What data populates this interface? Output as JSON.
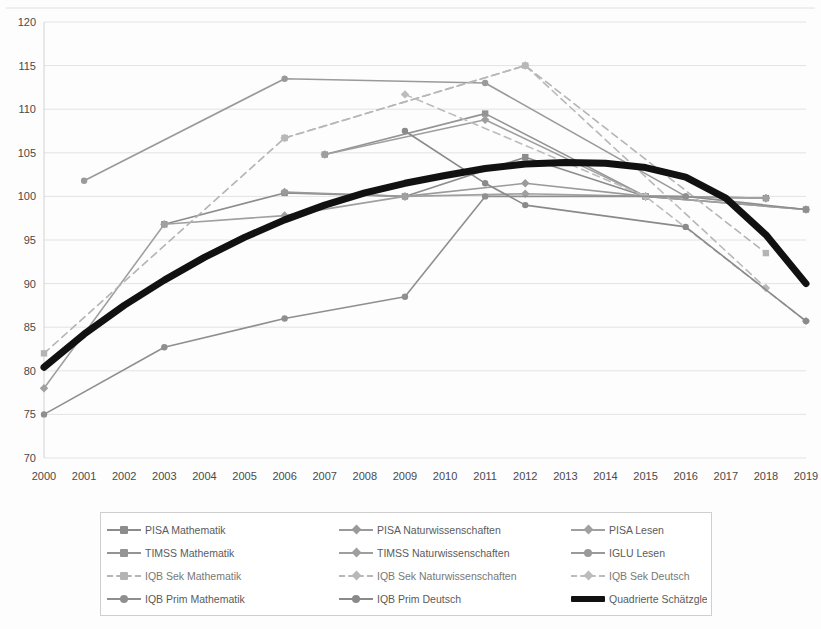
{
  "chart_data": {
    "type": "line",
    "title": "",
    "xlabel": "",
    "ylabel": "",
    "xlim": [
      2000,
      2019
    ],
    "ylim": [
      70,
      120
    ],
    "ytick_labels": [
      "120",
      "115",
      "110",
      "105",
      "100",
      "95",
      "90",
      "85",
      "80",
      "75",
      "70"
    ],
    "ytick_values": [
      120,
      115,
      110,
      105,
      100,
      95,
      90,
      85,
      80,
      75,
      70
    ],
    "xtick_labels": [
      "2000",
      "2001",
      "2002",
      "2003",
      "2004",
      "2005",
      "2006",
      "2007",
      "2008",
      "2009",
      "2010",
      "2011",
      "2012",
      "2013",
      "2014",
      "2015",
      "2016",
      "2017",
      "2018",
      "2019"
    ],
    "grid": true,
    "legend_position": "bottom",
    "series": [
      {
        "name": "PISA Mathematik",
        "color": "#8c8c8c",
        "style": "solid",
        "marker": "square",
        "points": [
          [
            2003,
            96.8
          ],
          [
            2006,
            100.4
          ],
          [
            2009,
            100.0
          ],
          [
            2012,
            104.5
          ],
          [
            2015,
            100.0
          ],
          [
            2018,
            99.8
          ]
        ]
      },
      {
        "name": "PISA Naturwissenschaften",
        "color": "#9a9a9a",
        "style": "solid",
        "marker": "diamond",
        "points": [
          [
            2006,
            100.5
          ],
          [
            2009,
            100.0
          ],
          [
            2012,
            101.5
          ],
          [
            2015,
            100.0
          ],
          [
            2018,
            99.8
          ]
        ]
      },
      {
        "name": "PISA Lesen",
        "color": "#a0a0a0",
        "style": "solid",
        "marker": "diamond",
        "points": [
          [
            2000,
            78.0
          ],
          [
            2003,
            96.8
          ],
          [
            2006,
            97.8
          ],
          [
            2009,
            100.0
          ],
          [
            2012,
            100.3
          ],
          [
            2015,
            100.0
          ],
          [
            2018,
            99.8
          ]
        ]
      },
      {
        "name": "TIMSS Mathematik",
        "color": "#949494",
        "style": "solid",
        "marker": "square",
        "points": [
          [
            2007,
            104.8
          ],
          [
            2011,
            109.5
          ],
          [
            2015,
            100.0
          ],
          [
            2019,
            98.5
          ]
        ]
      },
      {
        "name": "TIMSS Naturwissenschaften",
        "color": "#9e9e9e",
        "style": "solid",
        "marker": "diamond",
        "points": [
          [
            2007,
            104.8
          ],
          [
            2011,
            108.8
          ],
          [
            2015,
            100.0
          ],
          [
            2019,
            98.5
          ]
        ]
      },
      {
        "name": "IGLU Lesen",
        "color": "#9a9a9a",
        "style": "solid",
        "marker": "circle",
        "points": [
          [
            2001,
            101.8
          ],
          [
            2006,
            113.5
          ],
          [
            2011,
            113.0
          ],
          [
            2016,
            100.0
          ]
        ]
      },
      {
        "name": "IQB Sek Mathematik",
        "color": "#b4b4b4",
        "style": "dashed",
        "marker": "square",
        "points": [
          [
            2000,
            82.0
          ],
          [
            2006,
            106.7
          ],
          [
            2012,
            115.0
          ],
          [
            2018,
            93.5
          ]
        ]
      },
      {
        "name": "IQB Sek Naturwissenschaften",
        "color": "#b8b8b8",
        "style": "dashed",
        "marker": "diamond",
        "points": [
          [
            2006,
            106.7
          ],
          [
            2012,
            115.0
          ],
          [
            2018,
            89.5
          ]
        ]
      },
      {
        "name": "IQB Sek Deutsch",
        "color": "#bcbcbc",
        "style": "dashed",
        "marker": "diamond",
        "points": [
          [
            2009,
            111.7
          ],
          [
            2015,
            100.0
          ],
          [
            2019,
            85.7
          ]
        ]
      },
      {
        "name": "IQB Prim Mathematik",
        "color": "#8f8f8f",
        "style": "solid",
        "marker": "circle",
        "points": [
          [
            2000,
            75.0
          ],
          [
            2003,
            82.7
          ],
          [
            2006,
            86.0
          ],
          [
            2009,
            88.5
          ],
          [
            2011,
            100.0
          ],
          [
            2016,
            100.0
          ],
          [
            2019,
            98.5
          ]
        ]
      },
      {
        "name": "IQB Prim Deutsch",
        "color": "#8a8a8a",
        "style": "solid",
        "marker": "circle",
        "points": [
          [
            2009,
            107.5
          ],
          [
            2011,
            101.5
          ],
          [
            2012,
            99.0
          ],
          [
            2016,
            96.5
          ],
          [
            2019,
            85.7
          ]
        ]
      },
      {
        "name": "Quadrierte Schätzgleichung",
        "color": "#111111",
        "style": "thick",
        "marker": "none",
        "points": [
          [
            2000,
            80.4
          ],
          [
            2001,
            84.2
          ],
          [
            2002,
            87.5
          ],
          [
            2003,
            90.4
          ],
          [
            2004,
            93.0
          ],
          [
            2005,
            95.3
          ],
          [
            2006,
            97.3
          ],
          [
            2007,
            99.0
          ],
          [
            2008,
            100.4
          ],
          [
            2009,
            101.5
          ],
          [
            2010,
            102.4
          ],
          [
            2011,
            103.2
          ],
          [
            2012,
            103.7
          ],
          [
            2013,
            103.9
          ],
          [
            2014,
            103.8
          ],
          [
            2015,
            103.3
          ],
          [
            2016,
            102.2
          ],
          [
            2017,
            99.8
          ],
          [
            2018,
            95.6
          ],
          [
            2019,
            90.0
          ]
        ]
      }
    ]
  },
  "legend": {
    "items": [
      {
        "label": "PISA Mathematik",
        "color": "#8c8c8c",
        "style": "solid",
        "marker": "square"
      },
      {
        "label": "PISA Naturwissenschaften",
        "color": "#9a9a9a",
        "style": "solid",
        "marker": "diamond"
      },
      {
        "label": "PISA Lesen",
        "color": "#a0a0a0",
        "style": "solid",
        "marker": "diamond"
      },
      {
        "label": "TIMSS Mathematik",
        "color": "#949494",
        "style": "solid",
        "marker": "square"
      },
      {
        "label": "TIMSS Naturwissenschaften",
        "color": "#9e9e9e",
        "style": "solid",
        "marker": "diamond"
      },
      {
        "label": "IGLU Lesen",
        "color": "#9a9a9a",
        "style": "solid",
        "marker": "circle"
      },
      {
        "label": "IQB Sek Mathematik",
        "color": "#b4b4b4",
        "style": "dashed",
        "marker": "square"
      },
      {
        "label": "IQB Sek Naturwissenschaften",
        "color": "#b8b8b8",
        "style": "dashed",
        "marker": "diamond"
      },
      {
        "label": "IQB Sek Deutsch",
        "color": "#bcbcbc",
        "style": "dashed",
        "marker": "diamond"
      },
      {
        "label": "IQB Prim Mathematik",
        "color": "#8f8f8f",
        "style": "solid",
        "marker": "circle"
      },
      {
        "label": "IQB Prim Deutsch",
        "color": "#8a8a8a",
        "style": "solid",
        "marker": "circle"
      },
      {
        "label": "Quadrierte Schätzgleichung",
        "color": "#111111",
        "style": "thick",
        "marker": "none"
      }
    ]
  }
}
